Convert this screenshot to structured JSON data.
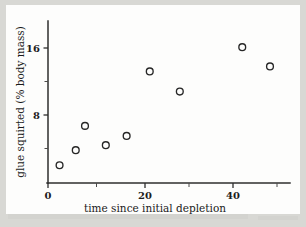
{
  "figure": {
    "background_color": "#d8d8d4",
    "paper_color": "#fdfdfc",
    "ink_color": "#262626"
  },
  "chart_data": {
    "type": "scatter",
    "title": "",
    "xlabel": "time since initial depletion",
    "ylabel": "glue squirted (% body mass)",
    "xlim": [
      0,
      52
    ],
    "ylim": [
      0,
      19
    ],
    "grid": false,
    "legend": null,
    "x_ticks_major": [
      0,
      20,
      40
    ],
    "x_tick_labels": [
      "0",
      "20",
      "40"
    ],
    "x_ticks_minor": [
      10,
      30,
      50
    ],
    "y_ticks_major": [
      8,
      16
    ],
    "y_tick_labels": [
      "8",
      "16"
    ],
    "y_ticks_minor": [
      4,
      12
    ],
    "marker_style": "open-circle",
    "x": [
      2.5,
      6.0,
      8.0,
      12.5,
      17.0,
      22.0,
      28.5,
      42.0,
      48.0
    ],
    "y": [
      2.0,
      3.8,
      6.7,
      4.4,
      5.5,
      13.2,
      10.8,
      16.1,
      13.8
    ],
    "points": [
      {
        "x": 2.5,
        "y": 2.0
      },
      {
        "x": 6.0,
        "y": 3.8
      },
      {
        "x": 8.0,
        "y": 6.7
      },
      {
        "x": 12.5,
        "y": 4.4
      },
      {
        "x": 17.0,
        "y": 5.5
      },
      {
        "x": 22.0,
        "y": 13.2
      },
      {
        "x": 28.5,
        "y": 10.8
      },
      {
        "x": 42.0,
        "y": 16.1
      },
      {
        "x": 48.0,
        "y": 13.8
      }
    ]
  }
}
